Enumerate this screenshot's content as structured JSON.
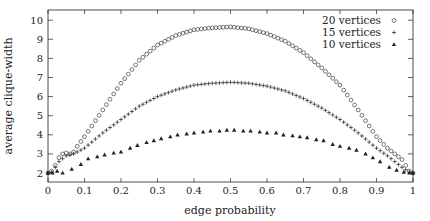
{
  "chart_data": {
    "type": "scatter",
    "title": "",
    "xlabel": "edge probability",
    "ylabel": "average clique-width",
    "xlim": [
      0,
      1
    ],
    "ylim": [
      1.8,
      10.5
    ],
    "xticks": [
      0,
      0.1,
      0.2,
      0.3,
      0.4,
      0.5,
      0.6,
      0.7,
      0.8,
      0.9,
      1
    ],
    "xtick_labels": [
      "0",
      "0.1",
      "0.2",
      "0.3",
      "0.4",
      "0.5",
      "0.6",
      "0.7",
      "0.8",
      "0.9",
      "1"
    ],
    "yticks": [
      2,
      3,
      4,
      5,
      6,
      7,
      8,
      9,
      10
    ],
    "ytick_labels": [
      "2",
      "3",
      "4",
      "5",
      "6",
      "7",
      "8",
      "9",
      "10"
    ],
    "grid": false,
    "legend_position": "upper right",
    "series": [
      {
        "name": "20 vertices",
        "marker": "circle-open",
        "peak": {
          "x": 0.5,
          "y": 9.65
        },
        "x": [
          0.0,
          0.01,
          0.02,
          0.03,
          0.04,
          0.05,
          0.06,
          0.07,
          0.08,
          0.1,
          0.15,
          0.2,
          0.25,
          0.3,
          0.35,
          0.4,
          0.45,
          0.5,
          0.55,
          0.6,
          0.65,
          0.7,
          0.75,
          0.8,
          0.85,
          0.9,
          0.93,
          0.95,
          0.97,
          0.99,
          1.0
        ],
        "y": [
          2.0,
          2.1,
          2.4,
          2.8,
          3.0,
          3.05,
          3.0,
          3.1,
          3.4,
          3.9,
          5.3,
          6.7,
          7.9,
          8.7,
          9.2,
          9.5,
          9.6,
          9.65,
          9.55,
          9.3,
          8.9,
          8.3,
          7.5,
          6.6,
          5.3,
          3.9,
          3.3,
          3.0,
          2.7,
          2.1,
          2.0
        ]
      },
      {
        "name": "15 vertices",
        "marker": "plus",
        "peak": {
          "x": 0.5,
          "y": 6.75
        },
        "x": [
          0.0,
          0.01,
          0.02,
          0.03,
          0.05,
          0.07,
          0.1,
          0.15,
          0.2,
          0.25,
          0.3,
          0.35,
          0.4,
          0.45,
          0.5,
          0.55,
          0.6,
          0.65,
          0.7,
          0.75,
          0.8,
          0.85,
          0.9,
          0.93,
          0.95,
          0.97,
          0.99,
          1.0
        ],
        "y": [
          2.0,
          2.05,
          2.3,
          2.6,
          2.9,
          3.0,
          3.3,
          4.1,
          4.8,
          5.5,
          6.0,
          6.35,
          6.6,
          6.7,
          6.75,
          6.7,
          6.55,
          6.3,
          5.9,
          5.4,
          4.8,
          4.1,
          3.3,
          2.9,
          2.6,
          2.3,
          2.05,
          2.0
        ]
      },
      {
        "name": "10 vertices",
        "marker": "triangle-filled",
        "peak": {
          "x": 0.49,
          "y": 4.25
        },
        "x": [
          0.0,
          0.0125,
          0.025,
          0.04,
          0.065,
          0.09,
          0.11,
          0.135,
          0.155,
          0.18,
          0.2,
          0.225,
          0.245,
          0.27,
          0.29,
          0.31,
          0.335,
          0.355,
          0.38,
          0.4,
          0.425,
          0.445,
          0.47,
          0.49,
          0.51,
          0.535,
          0.555,
          0.58,
          0.6,
          0.625,
          0.645,
          0.67,
          0.69,
          0.71,
          0.735,
          0.755,
          0.78,
          0.8,
          0.825,
          0.845,
          0.87,
          0.89,
          0.91,
          0.935,
          0.955,
          0.975,
          0.99,
          1.0
        ],
        "y": [
          2.0,
          2.0,
          2.1,
          2.0,
          2.2,
          2.45,
          2.75,
          2.85,
          2.95,
          3.05,
          3.1,
          3.3,
          3.45,
          3.6,
          3.7,
          3.8,
          3.9,
          4.0,
          4.05,
          4.1,
          4.15,
          4.2,
          4.2,
          4.25,
          4.25,
          4.2,
          4.2,
          4.15,
          4.1,
          4.1,
          4.0,
          3.95,
          3.9,
          3.85,
          3.75,
          3.7,
          3.5,
          3.4,
          3.3,
          3.2,
          3.0,
          2.8,
          2.6,
          2.3,
          2.15,
          2.05,
          2.0,
          2.0
        ]
      }
    ]
  },
  "legend": {
    "items": [
      {
        "label": "20 vertices",
        "marker": "circle-open"
      },
      {
        "label": "15 vertices",
        "marker": "plus"
      },
      {
        "label": "10 vertices",
        "marker": "triangle-filled"
      }
    ]
  },
  "colors": {
    "ink": "#222222",
    "background": "#ffffff"
  }
}
